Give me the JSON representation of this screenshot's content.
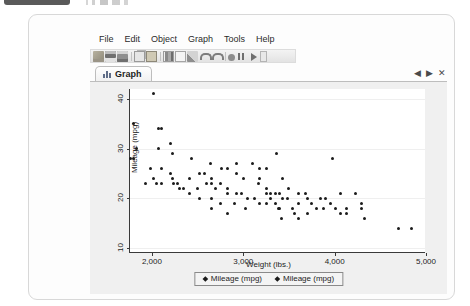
{
  "window": {
    "menu_items": [
      "File",
      "Edit",
      "Object",
      "Graph",
      "Tools",
      "Help"
    ],
    "toolbar_icons": [
      "open-folder-icon",
      "save-icon",
      "print-icon",
      "sep",
      "copy-icon",
      "paste-icon",
      "sep",
      "new-graph-icon",
      "data-editor-icon",
      "data-browser-icon",
      "sep",
      "undo-icon",
      "redo-icon",
      "sep",
      "stop-icon",
      "pause-icon",
      "run-icon",
      "more-icon"
    ],
    "tab": {
      "label": "Graph",
      "icon": "bar-chart-icon"
    },
    "tab_nav": {
      "prev": "◀",
      "next": "▶",
      "close": "✕"
    }
  },
  "chart_data": {
    "type": "scatter",
    "title": "",
    "xlabel": "Weight (lbs.)",
    "ylabel": "Mileage (mpg)",
    "xlim": [
      1760,
      5000
    ],
    "ylim": [
      9,
      42
    ],
    "xticks": [
      2000,
      3000,
      4000,
      5000
    ],
    "xticklabels": [
      "2,000",
      "3,000",
      "4,000",
      "5,000"
    ],
    "yticks": [
      10,
      20,
      30,
      40
    ],
    "yticklabels": [
      "10",
      "20",
      "30",
      "40"
    ],
    "grid": false,
    "legend_position": "bottom",
    "legend": [
      "Mileage (mpg)",
      "Mileage (mpg)"
    ],
    "marker": "diamond",
    "marker_color": "#1b1b1b",
    "points": [
      [
        2020,
        41
      ],
      [
        1800,
        35
      ],
      [
        1830,
        30
      ],
      [
        1760,
        28
      ],
      [
        1800,
        28
      ],
      [
        2070,
        34
      ],
      [
        2100,
        34
      ],
      [
        2230,
        29
      ],
      [
        2110,
        26
      ],
      [
        2200,
        25
      ],
      [
        2230,
        24
      ],
      [
        2020,
        24
      ],
      [
        1930,
        23
      ],
      [
        2050,
        23
      ],
      [
        2110,
        23
      ],
      [
        2240,
        23
      ],
      [
        2280,
        23
      ],
      [
        2300,
        22
      ],
      [
        2410,
        24
      ],
      [
        2520,
        25
      ],
      [
        2580,
        25
      ],
      [
        2650,
        24
      ],
      [
        2600,
        23
      ],
      [
        2650,
        23
      ],
      [
        2750,
        23
      ],
      [
        2700,
        22
      ],
      [
        2830,
        22
      ],
      [
        2830,
        21
      ],
      [
        2930,
        21
      ],
      [
        2410,
        21
      ],
      [
        2520,
        20
      ],
      [
        2650,
        20
      ],
      [
        2750,
        19
      ],
      [
        2900,
        19
      ],
      [
        2830,
        26
      ],
      [
        2930,
        25
      ],
      [
        3000,
        24
      ],
      [
        3180,
        24
      ],
      [
        3170,
        23
      ],
      [
        3250,
        22
      ],
      [
        3250,
        21
      ],
      [
        3300,
        21
      ],
      [
        3350,
        21
      ],
      [
        3400,
        21
      ],
      [
        3430,
        20
      ],
      [
        3300,
        20
      ],
      [
        3350,
        19
      ],
      [
        3180,
        19
      ],
      [
        3250,
        19
      ],
      [
        3380,
        18
      ],
      [
        3400,
        18
      ],
      [
        3180,
        26
      ],
      [
        3250,
        26
      ],
      [
        3430,
        24
      ],
      [
        3500,
        22
      ],
      [
        3600,
        21
      ],
      [
        3680,
        21
      ],
      [
        3700,
        20
      ],
      [
        3600,
        19
      ],
      [
        3750,
        19
      ],
      [
        3850,
        20
      ],
      [
        3900,
        20
      ],
      [
        3950,
        19
      ],
      [
        3880,
        18
      ],
      [
        3800,
        18
      ],
      [
        3560,
        17
      ],
      [
        3700,
        17
      ],
      [
        3420,
        16
      ],
      [
        3600,
        16
      ],
      [
        4060,
        21
      ],
      [
        4230,
        21
      ],
      [
        4130,
        18
      ],
      [
        4290,
        18
      ],
      [
        4060,
        17
      ],
      [
        4130,
        17
      ],
      [
        4330,
        16
      ],
      [
        4700,
        14
      ],
      [
        4840,
        14
      ],
      [
        4290,
        19
      ],
      [
        3980,
        28
      ],
      [
        3360,
        29
      ],
      [
        3100,
        27
      ],
      [
        2930,
        27
      ],
      [
        2430,
        28
      ],
      [
        2200,
        31
      ],
      [
        2070,
        30
      ],
      [
        1980,
        26
      ],
      [
        2650,
        18
      ],
      [
        3020,
        18
      ],
      [
        2830,
        17
      ],
      [
        2500,
        22
      ],
      [
        2350,
        22
      ],
      [
        3050,
        20
      ],
      [
        2980,
        21
      ],
      [
        3120,
        20
      ],
      [
        3540,
        18
      ],
      [
        3480,
        20
      ],
      [
        4010,
        18
      ],
      [
        2760,
        26
      ],
      [
        2640,
        27
      ]
    ]
  }
}
